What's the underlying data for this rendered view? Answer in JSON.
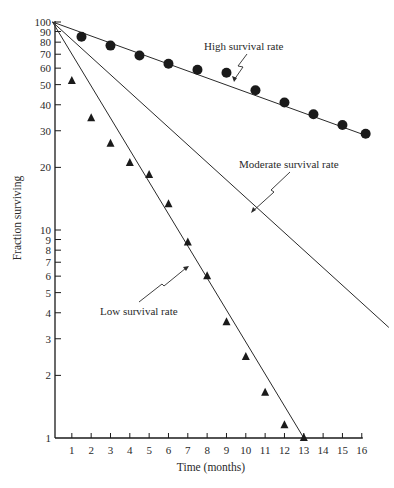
{
  "chart_data": {
    "type": "scatter",
    "title": "",
    "xlabel": "Time (months)",
    "ylabel": "Fraction surviving",
    "xlim": [
      0,
      16
    ],
    "ylim": [
      1,
      100
    ],
    "yscale": "log",
    "grid": false,
    "legend": "none (inline annotations)",
    "x_ticks": [
      1,
      2,
      3,
      4,
      5,
      6,
      7,
      8,
      9,
      10,
      11,
      12,
      13,
      14,
      15,
      16
    ],
    "y_ticks": [
      1,
      2,
      3,
      4,
      5,
      6,
      7,
      8,
      9,
      10,
      20,
      30,
      40,
      50,
      60,
      70,
      80,
      90,
      100
    ],
    "y_tick_labels": [
      "1",
      "2",
      "3",
      "4",
      "5",
      "6",
      "7",
      "8",
      "9",
      "10",
      "20",
      "30",
      "40",
      "50",
      "60",
      "70",
      "80",
      "90",
      "100"
    ],
    "series": [
      {
        "name": "High survival rate",
        "kind": "points",
        "marker": "circle",
        "x": [
          1.5,
          3,
          4.5,
          6,
          7.5,
          9,
          10.5,
          12,
          13.5,
          15,
          16.2
        ],
        "y": [
          85,
          77,
          69,
          63,
          59,
          57,
          47,
          41,
          36,
          32,
          29
        ]
      },
      {
        "name": "Low survival rate",
        "kind": "points",
        "marker": "triangle",
        "x": [
          1,
          2,
          3,
          4,
          5,
          6,
          7,
          8,
          9,
          10,
          11,
          12,
          13
        ],
        "y": [
          52,
          34.5,
          26,
          21,
          18.4,
          13.3,
          8.7,
          6.0,
          3.6,
          2.45,
          1.65,
          1.15,
          1.0
        ]
      }
    ],
    "lines": [
      {
        "name": "High survival rate",
        "x": [
          0,
          16.2
        ],
        "y": [
          100,
          28.5
        ]
      },
      {
        "name": "Moderate survival rate",
        "x": [
          0,
          17.4
        ],
        "y": [
          100,
          3.4
        ]
      },
      {
        "name": "Low survival rate",
        "x": [
          0,
          13
        ],
        "y": [
          100,
          1.0
        ]
      }
    ],
    "annotations": [
      {
        "text": "High survival rate",
        "target": "High survival rate line"
      },
      {
        "text": "Moderate survival rate",
        "target": "Moderate survival rate line"
      },
      {
        "text": "Low survival rate",
        "target": "Low survival rate line"
      }
    ]
  },
  "labels": {
    "xlabel": "Time (months)",
    "ylabel": "Fraction surviving",
    "high": "High survival rate",
    "moderate": "Moderate survival rate",
    "low": "Low survival rate"
  },
  "colors": {
    "ink": "#1a1a1a",
    "line": "#2a2a2a",
    "background": "#ffffff"
  }
}
